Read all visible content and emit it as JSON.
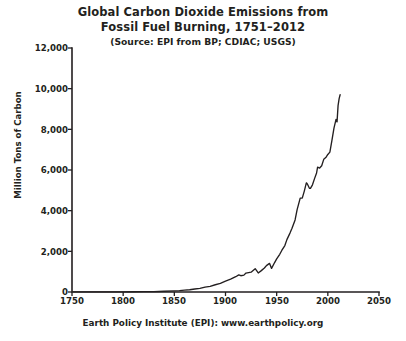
{
  "chart_data": {
    "type": "line",
    "title": "Global Carbon Dioxide Emissions from Fossil Fuel Burning, 1751–2012",
    "title_lines": [
      "Global Carbon Dioxide Emissions from",
      "Fossil Fuel Burning, 1751–2012"
    ],
    "source_note": "(Source: EPI from BP; CDIAC; USGS)",
    "footer": "Earth Policy Institute (EPI): www.earthpolicy.org",
    "xlabel": "",
    "ylabel": "Million Tons of Carbon",
    "xlim": [
      1750,
      2050
    ],
    "ylim": [
      0,
      12000
    ],
    "xticks": [
      1750,
      1800,
      1850,
      1900,
      1950,
      2000,
      2050
    ],
    "xtick_labels": [
      "1750",
      "1800",
      "1850",
      "1900",
      "1950",
      "2000",
      "2050"
    ],
    "yticks": [
      0,
      2000,
      4000,
      6000,
      8000,
      10000,
      12000
    ],
    "ytick_labels": [
      "0",
      "2,000",
      "4,000",
      "6,000",
      "8,000",
      "10,000",
      "12,000"
    ],
    "grid": false,
    "legend": false,
    "line_color": "#231f20",
    "background_color": "#ffffff",
    "series": [
      {
        "name": "Global CO2 emissions from fossil fuel burning",
        "units": "million tons of carbon",
        "x": [
          1751,
          1760,
          1770,
          1780,
          1790,
          1800,
          1810,
          1820,
          1830,
          1840,
          1850,
          1855,
          1860,
          1865,
          1870,
          1875,
          1880,
          1885,
          1890,
          1895,
          1900,
          1905,
          1910,
          1913,
          1915,
          1918,
          1920,
          1925,
          1929,
          1932,
          1935,
          1938,
          1940,
          1943,
          1945,
          1948,
          1950,
          1953,
          1955,
          1958,
          1960,
          1963,
          1965,
          1968,
          1970,
          1973,
          1975,
          1977,
          1979,
          1980,
          1982,
          1983,
          1985,
          1987,
          1989,
          1990,
          1992,
          1994,
          1996,
          1998,
          2000,
          2002,
          2004,
          2006,
          2008,
          2009,
          2010,
          2011,
          2012
        ],
        "values": [
          3,
          3,
          4,
          5,
          7,
          8,
          11,
          15,
          22,
          35,
          54,
          68,
          91,
          109,
          147,
          178,
          236,
          281,
          357,
          423,
          534,
          629,
          751,
          843,
          800,
          830,
          932,
          975,
          1145,
          938,
          1052,
          1180,
          1299,
          1409,
          1160,
          1448,
          1630,
          1855,
          2043,
          2283,
          2577,
          2897,
          3136,
          3545,
          4053,
          4614,
          4615,
          4964,
          5369,
          5315,
          5103,
          5095,
          5271,
          5575,
          5852,
          6143,
          6098,
          6211,
          6524,
          6613,
          6765,
          6880,
          7452,
          8062,
          8487,
          8366,
          9167,
          9500,
          9700
        ],
        "annotations": [
          {
            "label": "1751 start of series",
            "x": 1751,
            "y": 3
          },
          {
            "label": "World War I decline",
            "x": 1918,
            "y": 830
          },
          {
            "label": "Great Depression low",
            "x": 1932,
            "y": 938
          },
          {
            "label": "World War II end decline",
            "x": 1945,
            "y": 1160
          },
          {
            "label": "Oil crisis plateau",
            "x": 1982,
            "y": 5103
          },
          {
            "label": "2012 latest value",
            "x": 2012,
            "y": 9700
          }
        ]
      }
    ]
  }
}
